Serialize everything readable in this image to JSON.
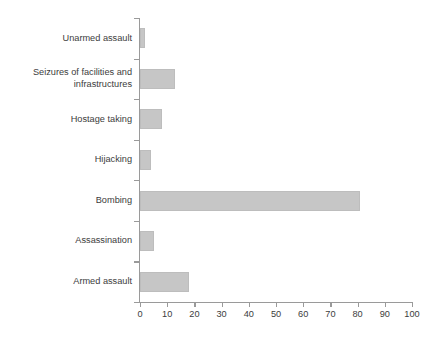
{
  "chart_data": {
    "type": "bar",
    "orientation": "horizontal",
    "title": "",
    "subtitle": "",
    "xlabel": "",
    "ylabel": "",
    "categories": [
      "Unarmed assault",
      "Seizures of facilities and\ninfrastructures",
      "Hostage taking",
      "Hijacking",
      "Bombing",
      "Assassination",
      "Armed assault"
    ],
    "values": [
      2,
      13,
      8,
      4,
      81,
      5,
      18
    ],
    "xlim": [
      0,
      100
    ],
    "xticks": [
      0,
      10,
      20,
      30,
      40,
      50,
      60,
      70,
      80,
      90,
      100
    ],
    "xtick_labels": [
      "0",
      "10",
      "20",
      "30",
      "40",
      "50",
      "60",
      "70",
      "80",
      "90",
      "100"
    ],
    "grid": false,
    "legend": null,
    "legend_position": "none",
    "bar_color": "#c6c6c6",
    "axis_color": "#9a9a9a",
    "text_color": "#3c3c3c",
    "background": "#ffffff"
  }
}
